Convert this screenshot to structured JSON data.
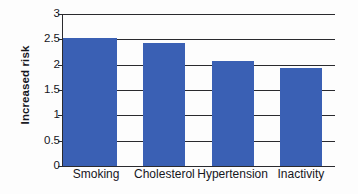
{
  "chart_data": {
    "type": "bar",
    "title": "",
    "subtitle": "",
    "xlabel": "",
    "ylabel": "Increased risk",
    "categories": [
      "Smoking",
      "Cholesterol",
      "Hypertension",
      "Inactivity"
    ],
    "values": [
      2.52,
      2.43,
      2.08,
      1.93
    ],
    "series": [
      {
        "name": "Increased risk",
        "values": [
          2.52,
          2.43,
          2.08,
          1.93
        ]
      }
    ],
    "ylim": [
      0,
      3
    ],
    "yticks": [
      0,
      0.5,
      1,
      1.5,
      2,
      2.5,
      3
    ],
    "ytick_labels": [
      "0",
      "0.5",
      "1",
      "1.5",
      "2",
      "2.5",
      "3"
    ],
    "grid": true,
    "grid_axis": "y",
    "legend": false,
    "legend_position": "none",
    "bar_color": "#3a60b4",
    "grid_color": "#2a2a2e",
    "axis_color": "#2a2a2e",
    "text_color": "#16161c",
    "background_color": "#fdfdfd",
    "annotations": []
  }
}
